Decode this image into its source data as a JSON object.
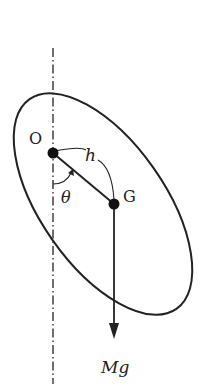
{
  "diagram": {
    "type": "physical pendulum free-body diagram",
    "labels": {
      "pivot": "O",
      "center_of_mass": "G",
      "distance": "h",
      "angle": "θ",
      "weight": "Mg"
    },
    "colors": {
      "stroke": "#222222",
      "background": "#ffffff"
    },
    "elements": [
      "vertical dash-dot reference axis through O",
      "tilted elliptical rigid body",
      "pivot point O",
      "center of mass G",
      "line segment OG of length h",
      "angle θ between vertical and OG",
      "downward weight vector Mg at G"
    ]
  }
}
